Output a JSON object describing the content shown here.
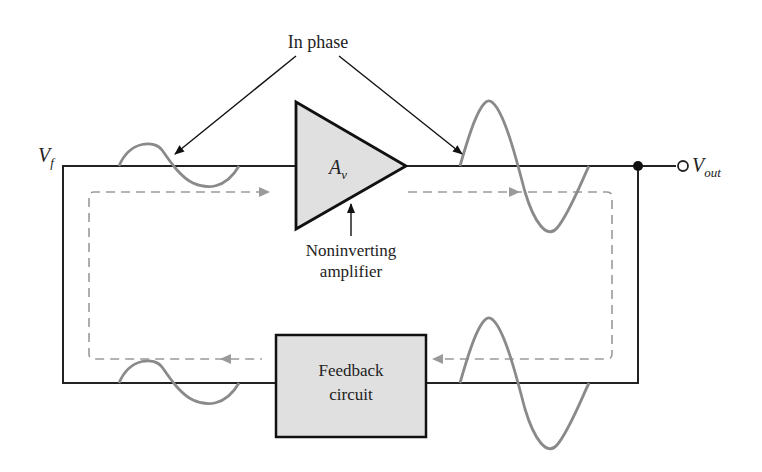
{
  "diagram": {
    "title_annotation": "In phase",
    "amplifier": {
      "label": "A",
      "subscript": "v",
      "caption_line1": "Noninverting",
      "caption_line2": "amplifier"
    },
    "feedback": {
      "line1": "Feedback",
      "line2": "circuit"
    },
    "input_label": {
      "main": "V",
      "sub": "f"
    },
    "output_label": {
      "main": "V",
      "sub": "out"
    },
    "colors": {
      "wire": "#222222",
      "signal": "#8a8a8a",
      "dashed": "#9a9a9a",
      "block_fill": "#e0e0e0"
    }
  }
}
